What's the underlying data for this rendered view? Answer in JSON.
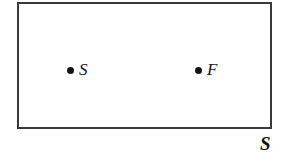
{
  "figure": {
    "type": "geometric-region-diagram",
    "background_color": "#ffffff",
    "region": {
      "name": "region-rectangle",
      "label": "S",
      "border_color": "#3a3a3a",
      "border_width_px": 2,
      "fill_color": "#ffffff",
      "bounds_px": {
        "x": 17,
        "y": 2,
        "width": 255,
        "height": 127
      }
    },
    "points": [
      {
        "id": "start",
        "label": "S",
        "marker": "filled-dot",
        "marker_color": "#111111",
        "marker_diameter_px": 7,
        "position_px": {
          "x": 71,
          "y": 66
        }
      },
      {
        "id": "finish",
        "label": "F",
        "marker": "filled-dot",
        "marker_color": "#111111",
        "marker_diameter_px": 7,
        "position_px": {
          "x": 199,
          "y": 66
        }
      }
    ]
  }
}
